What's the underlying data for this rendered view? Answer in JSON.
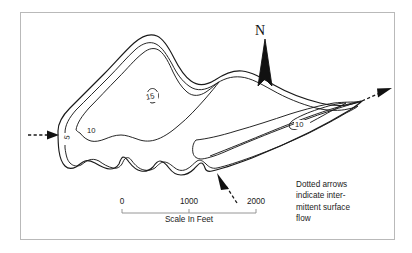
{
  "figure": {
    "type": "bathymetric-contour-map",
    "background_color": "#ffffff",
    "frame_color": "#b9b9b9",
    "line_color": "#1a1a1a"
  },
  "north_arrow": {
    "label": "N"
  },
  "scale_bar": {
    "caption": "Scale In Feet",
    "ticks": [
      {
        "label": "0",
        "value": 0
      },
      {
        "label": "1000",
        "value": 1000
      },
      {
        "label": "2000",
        "value": 2000
      }
    ],
    "units": "feet"
  },
  "legend": {
    "lines": [
      "Dotted arrows",
      "indicate inter-",
      "mittent surface",
      "flow"
    ]
  },
  "contour_labels": [
    {
      "text": "5",
      "depth": 5
    },
    {
      "text": "10",
      "depth": 10
    },
    {
      "text": "15",
      "depth": 15
    },
    {
      "text": "10",
      "depth": 10
    }
  ],
  "flow_arrows": [
    {
      "name": "inflow-west",
      "direction": "east"
    },
    {
      "name": "outflow-east",
      "direction": "northeast"
    },
    {
      "name": "inflow-south",
      "direction": "northwest"
    }
  ]
}
